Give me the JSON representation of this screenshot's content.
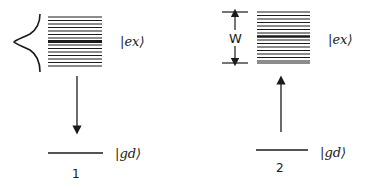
{
  "diagram": {
    "type": "energy-level diagram",
    "panels": [
      {
        "id": "1",
        "caption": "1",
        "excited_label": "|ex⟩",
        "ground_label": "|gd⟩",
        "transition": "downward arrow (emission)",
        "extras": "Gaussian lineshape envelope drawn to the left of the excited-state band",
        "band_line_count": 16
      },
      {
        "id": "2",
        "caption": "2",
        "excited_label": "|ex⟩",
        "ground_label": "|gd⟩",
        "transition": "upward arrow (absorption)",
        "extras": "band width marker",
        "width_label": "W",
        "band_line_count": 16
      }
    ],
    "colors": {
      "ink": "#1a1a1a",
      "background": "#ffffff"
    }
  }
}
